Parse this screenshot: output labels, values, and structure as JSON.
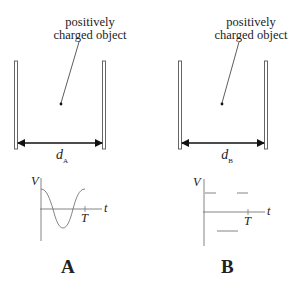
{
  "panels": [
    {
      "id": "A",
      "letter": "A",
      "object_label_line1": "positively",
      "object_label_line2": "charged object",
      "distance_label": "d",
      "distance_subscript": "A",
      "graph": {
        "y_axis_label": "V",
        "x_axis_label": "t",
        "period_label": "T",
        "waveform": "cosine"
      }
    },
    {
      "id": "B",
      "letter": "B",
      "object_label_line1": "positively",
      "object_label_line2": "charged object",
      "distance_label": "d",
      "distance_subscript": "B",
      "graph": {
        "y_axis_label": "V",
        "x_axis_label": "t",
        "period_label": "T",
        "waveform": "square"
      }
    }
  ],
  "colors": {
    "line": "#222222",
    "plate": "#555555",
    "graph_line": "#666666"
  }
}
